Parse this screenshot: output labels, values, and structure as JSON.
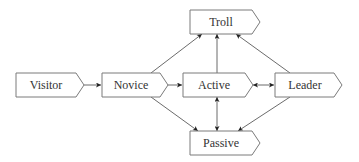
{
  "diagram": {
    "type": "state-transition",
    "colors": {
      "node_fill": "#ffffff",
      "node_stroke": "#7a7a7a",
      "edge": "#5a5a5a",
      "text": "#333333"
    },
    "nodes": {
      "visitor": {
        "label": "Visitor"
      },
      "novice": {
        "label": "Novice"
      },
      "active": {
        "label": "Active"
      },
      "leader": {
        "label": "Leader"
      },
      "troll": {
        "label": "Troll"
      },
      "passive": {
        "label": "Passive"
      }
    },
    "edges": [
      {
        "from": "Visitor",
        "to": "Novice",
        "direction": "forward"
      },
      {
        "from": "Novice",
        "to": "Active",
        "direction": "forward"
      },
      {
        "from": "Novice",
        "to": "Troll",
        "direction": "forward"
      },
      {
        "from": "Novice",
        "to": "Passive",
        "direction": "forward"
      },
      {
        "from": "Active",
        "to": "Troll",
        "direction": "forward"
      },
      {
        "from": "Active",
        "to": "Passive",
        "direction": "bidirectional"
      },
      {
        "from": "Active",
        "to": "Leader",
        "direction": "bidirectional"
      },
      {
        "from": "Leader",
        "to": "Troll",
        "direction": "forward"
      },
      {
        "from": "Leader",
        "to": "Passive",
        "direction": "forward"
      }
    ]
  }
}
